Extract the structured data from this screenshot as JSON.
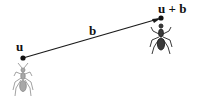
{
  "diagram": {
    "start_point": {
      "label": "u",
      "x": 23,
      "y": 58
    },
    "end_point": {
      "label": "u + b",
      "x": 161,
      "y": 18
    },
    "vector": {
      "label": "b",
      "color": "#1a1a1a"
    },
    "ants": [
      {
        "name": "ant-start",
        "position": "below u",
        "color": "#9a9a9a"
      },
      {
        "name": "ant-end",
        "position": "below u + b",
        "color": "#2a2a2a"
      }
    ]
  }
}
